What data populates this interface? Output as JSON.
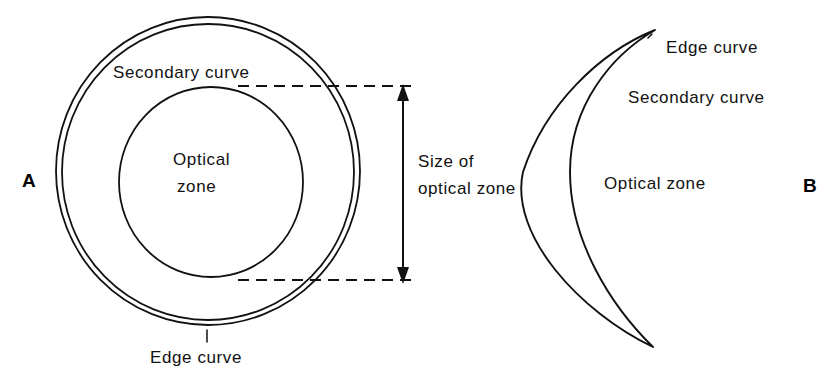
{
  "figure": {
    "width": 834,
    "height": 387,
    "background_color": "#ffffff",
    "line_color": "#111111",
    "type": "diagram"
  },
  "panel_a": {
    "label": "A",
    "labels": {
      "secondary_curve": "Secondary curve",
      "optical_zone_line1": "Optical",
      "optical_zone_line2": "zone",
      "edge_curve": "Edge curve"
    },
    "dimension": {
      "line1": "Size of",
      "line2": "optical zone"
    }
  },
  "panel_b": {
    "label": "B",
    "labels": {
      "edge_curve": "Edge curve",
      "secondary_curve": "Secondary curve",
      "optical_zone": "Optical zone"
    }
  }
}
